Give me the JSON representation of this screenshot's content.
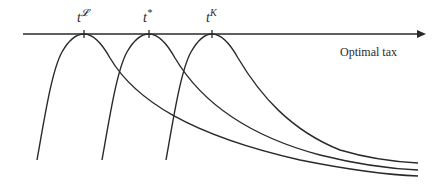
{
  "diagram": {
    "axis_label": "Optimal tax",
    "ticks": [
      {
        "base": "t",
        "sup": "𝓛",
        "x": 84
      },
      {
        "base": "t",
        "sup": "*",
        "x": 149
      },
      {
        "base": "t",
        "sup": "K",
        "x": 212
      }
    ],
    "curves": [
      {
        "name": "curve-left",
        "peak_x": 84
      },
      {
        "name": "curve-middle",
        "peak_x": 149
      },
      {
        "name": "curve-right",
        "peak_x": 212
      }
    ],
    "colors": {
      "line": "#2a2a2a",
      "background": "#ffffff"
    }
  }
}
